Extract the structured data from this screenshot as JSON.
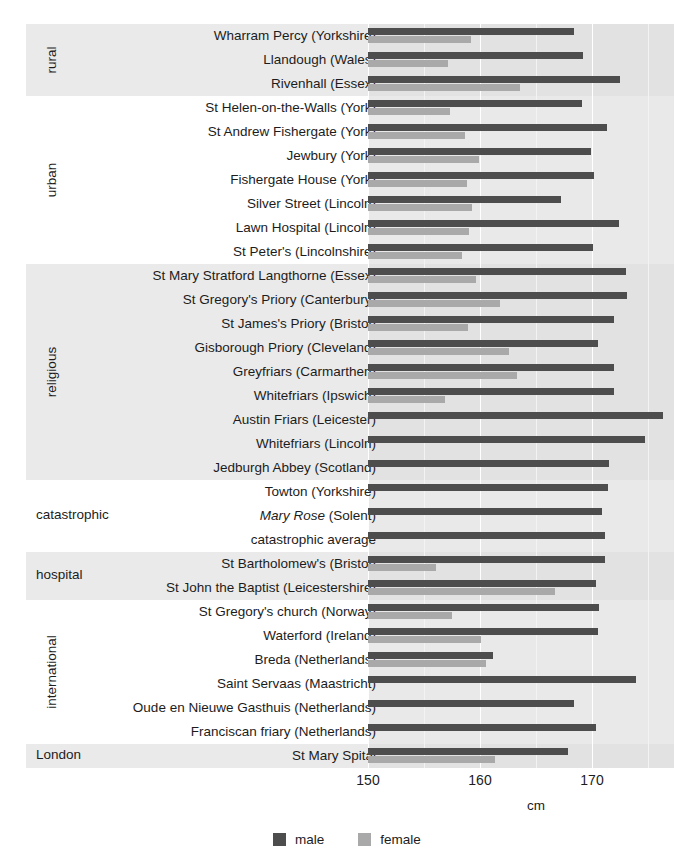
{
  "chart_data": {
    "type": "bar",
    "orientation": "horizontal",
    "title": "",
    "xlabel": "cm",
    "ylabel": "",
    "xlim": [
      150,
      177.5
    ],
    "xticks": [
      150,
      160,
      170
    ],
    "xtick_labels": [
      "150",
      "160",
      "170"
    ],
    "minor_gridlines": [
      155,
      165,
      175
    ],
    "grid": true,
    "legend_position": "bottom",
    "colors": {
      "male": "#4d4d4d",
      "female": "#a9a9a9",
      "panel": "#e3e3e3",
      "band_shaded": "#eaeaea",
      "gridline": "#ffffff"
    },
    "series": [
      {
        "name": "male",
        "label": "male",
        "color": "#4d4d4d"
      },
      {
        "name": "female",
        "label": "female",
        "color": "#a9a9a9"
      }
    ],
    "groups": [
      {
        "name": "rural",
        "label": "rural",
        "orientation": "vertical",
        "shaded": true,
        "rows": [
          {
            "label": "Wharram Percy (Yorkshire)",
            "male": 168.4,
            "female": 159.2
          },
          {
            "label": "Llandough (Wales)",
            "male": 169.2,
            "female": 157.1
          },
          {
            "label": "Rivenhall (Essex)",
            "male": 172.5,
            "female": 163.6
          }
        ]
      },
      {
        "name": "urban",
        "label": "urban",
        "orientation": "vertical",
        "shaded": false,
        "rows": [
          {
            "label": "St Helen-on-the-Walls (York)",
            "male": 169.1,
            "female": 157.3
          },
          {
            "label": "St Andrew Fishergate (York)",
            "male": 171.3,
            "female": 158.7
          },
          {
            "label": "Jewbury (York)",
            "male": 169.9,
            "female": 159.9
          },
          {
            "label": "Fishergate House (York)",
            "male": 170.2,
            "female": 158.8
          },
          {
            "label": "Silver Street (Lincoln)",
            "male": 167.2,
            "female": 159.3
          },
          {
            "label": "Lawn Hospital (Lincoln)",
            "male": 172.4,
            "female": 159.0
          },
          {
            "label": "St Peter's (Lincolnshire)",
            "male": 170.1,
            "female": 158.4
          }
        ]
      },
      {
        "name": "religious",
        "label": "religious",
        "orientation": "vertical",
        "shaded": true,
        "rows": [
          {
            "label": "St Mary Stratford Langthorne (Essex)",
            "male": 173.0,
            "female": 159.6
          },
          {
            "label": "St Gregory's Priory (Canterbury)",
            "male": 173.1,
            "female": 161.8
          },
          {
            "label": "St James's Priory (Bristol)",
            "male": 172.0,
            "female": 158.9
          },
          {
            "label": "Gisborough Priory (Cleveland)",
            "male": 170.5,
            "female": 162.6
          },
          {
            "label": "Greyfriars (Carmarthen)",
            "male": 172.0,
            "female": 163.3
          },
          {
            "label": "Whitefriars (Ipswich)",
            "male": 172.0,
            "female": 156.9
          },
          {
            "label": "Austin Friars (Leicester)",
            "male": 176.3,
            "female": null
          },
          {
            "label": "Whitefriars (Lincoln)",
            "male": 174.7,
            "female": null
          },
          {
            "label": "Jedburgh Abbey (Scotland)",
            "male": 171.5,
            "female": null
          }
        ]
      },
      {
        "name": "catastrophic",
        "label": "catastrophic",
        "orientation": "horizontal",
        "shaded": false,
        "rows": [
          {
            "label": "Towton (Yorkshire)",
            "male": 171.4,
            "female": null
          },
          {
            "label": "Mary Rose (Solent)",
            "label_italic_prefix": "Mary Rose",
            "label_rest": " (Solent)",
            "male": 170.9,
            "female": null
          },
          {
            "label": "catastrophic average",
            "male": 171.2,
            "female": null
          }
        ]
      },
      {
        "name": "hospital",
        "label": "hospital",
        "orientation": "horizontal",
        "shaded": true,
        "rows": [
          {
            "label": "St Bartholomew's (Bristol)",
            "male": 171.2,
            "female": 156.1
          },
          {
            "label": "St John the Baptist (Leicestershire)",
            "male": 170.4,
            "female": 166.7
          }
        ]
      },
      {
        "name": "international",
        "label": "international",
        "orientation": "vertical",
        "shaded": false,
        "rows": [
          {
            "label": "St Gregory's church (Norway)",
            "male": 170.6,
            "female": 157.5
          },
          {
            "label": "Waterford (Ireland)",
            "male": 170.5,
            "female": 160.1
          },
          {
            "label": "Breda (Netherlands)",
            "male": 161.2,
            "female": 160.5
          },
          {
            "label": "Saint Servaas (Maastricht)",
            "male": 173.9,
            "female": null
          },
          {
            "label": "Oude en Nieuwe Gasthuis (Netherlands)",
            "male": 168.4,
            "female": null
          },
          {
            "label": "Franciscan friary (Netherlands)",
            "male": 170.4,
            "female": null
          }
        ]
      },
      {
        "name": "london",
        "label": "London",
        "orientation": "horizontal",
        "shaded": true,
        "rows": [
          {
            "label": "St Mary Spital",
            "male": 167.9,
            "female": 161.3
          }
        ]
      }
    ]
  },
  "legend": {
    "male_label": "male",
    "female_label": "female"
  },
  "axis": {
    "x_title": "cm",
    "ticks": [
      "150",
      "160",
      "170"
    ]
  }
}
